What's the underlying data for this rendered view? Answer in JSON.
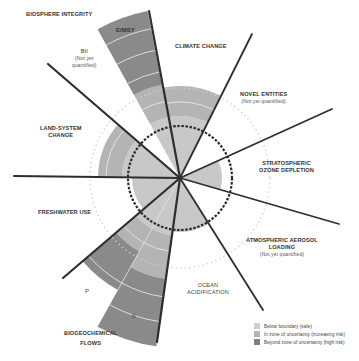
{
  "diagram": {
    "center": [
      180,
      178
    ],
    "colors": {
      "safe": "#c6c6c6",
      "uncertainty": "#b0b0b0",
      "high_risk": "#8a8a8a",
      "line": "#2e2e2e"
    },
    "boundary_circle_radius": 52,
    "uncertainty_circle_radius": 90
  },
  "labels": {
    "biosphere": "BIOSPHERE INTEGRITY",
    "emsy": "E/MSY",
    "bii": "BII",
    "bii_note": "(Not yet quantified)",
    "bii_note_line1": "(Not yet",
    "bii_note_line2": "quantified)",
    "climate": "CLIMATE CHANGE",
    "novel_line1": "NOVEL ENTITIES",
    "novel_note": "(Not yet quantified)",
    "ozone_line1": "STRATOSPHERIC",
    "ozone_line2": "OZONE DEPLETION",
    "aerosol_line1": "ATMOSPHERIC AEROSOL",
    "aerosol_line2": "LOADING",
    "aerosol_note": "(Not yet quantified)",
    "ocean_line1": "OCEAN",
    "ocean_line2": "ACIDIFICATION",
    "biogeo_line1": "BIOGEOCHEMICAL",
    "biogeo_line2": "FLOWS",
    "p": "P",
    "n": "N",
    "freshwater": "FRESHWATER USE",
    "land_line1": "LAND-SYSTEM",
    "land_line2": "CHANGE"
  },
  "legend": {
    "items": [
      {
        "label": "Below boundary (safe)",
        "color": "#cfcfcf"
      },
      {
        "label": "In zone of uncertainty (increasing risk)",
        "color": "#b3b3b3"
      },
      {
        "label": "Beyond zone of uncertainty (high risk)",
        "color": "#7f7f7f"
      }
    ]
  }
}
